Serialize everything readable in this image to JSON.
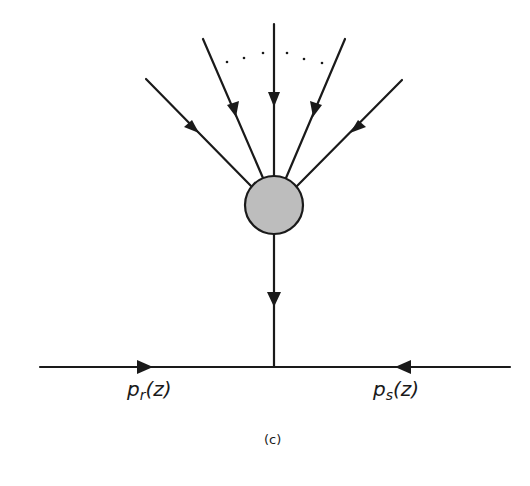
{
  "figure": {
    "caption": "(c)",
    "colors": {
      "line": "#1a1a1a",
      "blob_fill": "#bdbdbd"
    },
    "blob": {
      "cx": 274,
      "cy": 205,
      "r": 29
    },
    "incoming_lines": [
      {
        "x1": 146,
        "y1": 79,
        "x2": 252,
        "y2": 187
      },
      {
        "x1": 203,
        "y1": 39,
        "x2": 263,
        "y2": 178
      },
      {
        "x1": 274,
        "y1": 24,
        "x2": 274,
        "y2": 176
      },
      {
        "x1": 345,
        "y1": 39,
        "x2": 286,
        "y2": 178
      },
      {
        "x1": 402,
        "y1": 80,
        "x2": 296,
        "y2": 187
      }
    ],
    "ellipsis_dots": [
      [
        227,
        62
      ],
      [
        244,
        58
      ],
      [
        263,
        53
      ],
      [
        287,
        53
      ],
      [
        304,
        59
      ],
      [
        322,
        63
      ]
    ],
    "stem_line": {
      "x1": 274,
      "y1": 234,
      "x2": 274,
      "y2": 367
    },
    "baseline": {
      "x1": 40,
      "y1": 367,
      "x2": 510,
      "y2": 367
    },
    "labels": {
      "left": {
        "base": "p",
        "sub": "r",
        "arg": "(z)"
      },
      "right": {
        "base": "p",
        "sub": "s",
        "arg": "(z)"
      }
    }
  }
}
